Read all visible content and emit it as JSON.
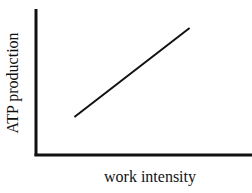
{
  "chart_data": {
    "type": "line",
    "title": "",
    "xlabel": "work intensity",
    "ylabel": "ATP production",
    "x_ticks": [],
    "y_ticks": [],
    "grid": false,
    "legend": null,
    "series": [
      {
        "name": "ATP production vs work intensity",
        "x": [
          0.2,
          0.8
        ],
        "y": [
          0.26,
          0.87
        ],
        "trend": "linear increasing"
      }
    ],
    "xlim": [
      0,
      1
    ],
    "ylim": [
      0,
      1
    ]
  },
  "style": {
    "axis_color": "#111111",
    "line_color": "#111111",
    "background": "#ffffff"
  }
}
